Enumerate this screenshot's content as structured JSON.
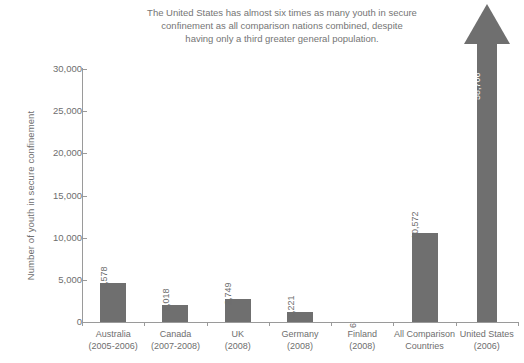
{
  "chart_data": {
    "type": "bar",
    "title": "The United States has almost six times as many youth in secure\nconfinement as all comparison nations combined, despite\nhaving only a third greater general population.",
    "xlabel": "",
    "ylabel": "Number of youth in secure confinement",
    "ylim": [
      0,
      30000
    ],
    "yticks": [
      "0",
      "5,000",
      "10,000",
      "15,000",
      "20,000",
      "25,000",
      "30,000"
    ],
    "ytick_values": [
      0,
      5000,
      10000,
      15000,
      20000,
      25000,
      30000
    ],
    "grid": false,
    "legend": "none",
    "categories": [
      "Australia (2005-2006)",
      "Canada (2007-2008)",
      "UK (2008)",
      "Germany (2008)",
      "Finland (2008)",
      "All Comparison Countries",
      "United States (2006)"
    ],
    "values": [
      4578,
      2018,
      2749,
      1221,
      6,
      10572,
      58706
    ],
    "value_labels": [
      "4,578",
      "2,018",
      "2,749",
      "1,221",
      "6",
      "10,572",
      "58,706"
    ],
    "bar_color": "#6f6f6f",
    "text_color": "#6e6e6e",
    "background_color": "#ffffff"
  },
  "axis": {
    "y_title": "Number of youth in secure confinement"
  },
  "categories_detail": [
    {
      "name": "Australia",
      "year": "(2005-2006)"
    },
    {
      "name": "Canada",
      "year": "(2007-2008)"
    },
    {
      "name": "UK",
      "year": "(2008)"
    },
    {
      "name": "Germany",
      "year": "(2008)"
    },
    {
      "name": "Finland",
      "year": "(2008)"
    },
    {
      "name": "All Comparison",
      "year": "Countries"
    },
    {
      "name": "United States",
      "year": "(2006)"
    }
  ]
}
